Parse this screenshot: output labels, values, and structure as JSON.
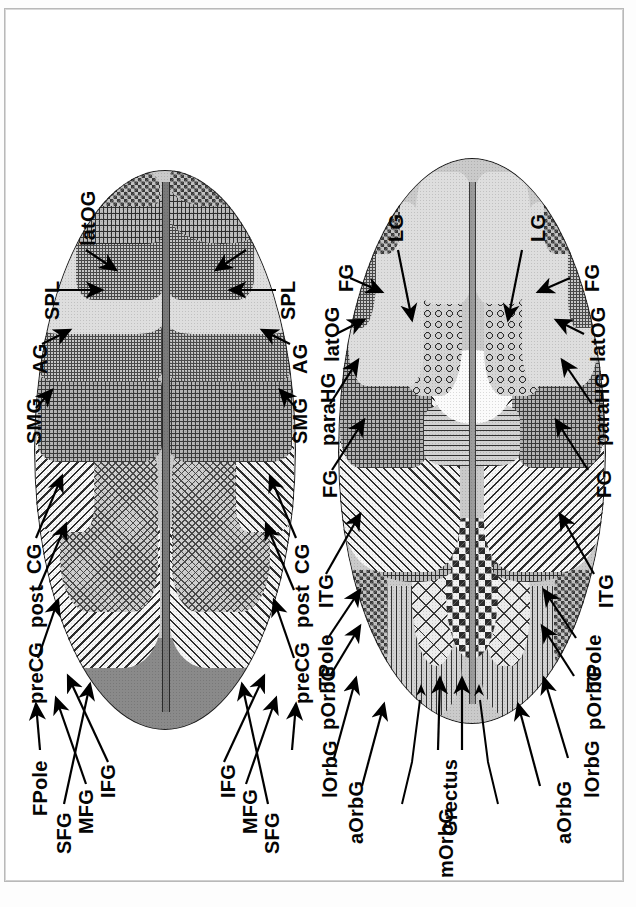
{
  "figure": {
    "type": "anatomical-atlas-plate",
    "orientation": "rotated-90-ccw",
    "panel_count": 2,
    "panels": [
      {
        "id": "panel-superior",
        "view": "superior (dorsal) view of cerebral hemispheres",
        "labels": [
          {
            "id": "p1-l-ifg",
            "text": "IFG"
          },
          {
            "id": "p1-l-mfg",
            "text": "MFG"
          },
          {
            "id": "p1-l-sfg",
            "text": "SFG"
          },
          {
            "id": "p1-l-fpole",
            "text": "FPole"
          },
          {
            "id": "p1-r-sfg",
            "text": "SFG"
          },
          {
            "id": "p1-r-mfg",
            "text": "MFG"
          },
          {
            "id": "p1-r-ifg",
            "text": "IFG"
          },
          {
            "id": "p1-l-precg",
            "text": "preCG"
          },
          {
            "id": "p1-l-post",
            "text": "post"
          },
          {
            "id": "p1-l-cg",
            "text": "CG"
          },
          {
            "id": "p1-l-smg",
            "text": "SMG"
          },
          {
            "id": "p1-l-ag",
            "text": "AG"
          },
          {
            "id": "p1-l-spl",
            "text": "SPL"
          },
          {
            "id": "p1-latog",
            "text": "latOG"
          },
          {
            "id": "p1-r-spl",
            "text": "SPL"
          },
          {
            "id": "p1-r-ag",
            "text": "AG"
          },
          {
            "id": "p1-r-smg",
            "text": "SMG"
          },
          {
            "id": "p1-r-cg",
            "text": "CG"
          },
          {
            "id": "p1-r-post",
            "text": "post"
          },
          {
            "id": "p1-r-precg",
            "text": "preCG"
          }
        ]
      },
      {
        "id": "panel-inferior",
        "view": "inferior (ventral) view of cerebral hemispheres",
        "labels": [
          {
            "id": "p2-l-lorbg",
            "text": "lOrbG"
          },
          {
            "id": "p2-l-aorbg",
            "text": "aOrbG"
          },
          {
            "id": "p2-morbg",
            "text": "mOrbG"
          },
          {
            "id": "p2-grectus",
            "text": "Grectus"
          },
          {
            "id": "p2-r-aorbg",
            "text": "aOrbG"
          },
          {
            "id": "p2-r-lorbg",
            "text": "lOrbG"
          },
          {
            "id": "p2-l-porbg",
            "text": "pOrbG"
          },
          {
            "id": "p2-l-tpole",
            "text": "TPole"
          },
          {
            "id": "p2-r-porbg",
            "text": "pOrbG"
          },
          {
            "id": "p2-r-tpole",
            "text": "TPole"
          },
          {
            "id": "p2-l-itg",
            "text": "ITG"
          },
          {
            "id": "p2-l-fg",
            "text": "FG"
          },
          {
            "id": "p2-l-parahg",
            "text": "paraHG"
          },
          {
            "id": "p2-l-latog",
            "text": "latOG"
          },
          {
            "id": "p2-l-fg2",
            "text": "FG"
          },
          {
            "id": "p2-l-lg",
            "text": "LG"
          },
          {
            "id": "p2-r-lg",
            "text": "LG"
          },
          {
            "id": "p2-r-fg",
            "text": "FG"
          },
          {
            "id": "p2-r-latog",
            "text": "latOG"
          },
          {
            "id": "p2-r-parahg",
            "text": "paraHG"
          },
          {
            "id": "p2-r-fg2",
            "text": "FG"
          },
          {
            "id": "p2-r-itg",
            "text": "ITG"
          }
        ]
      }
    ],
    "abbreviation_glossary": [
      {
        "abbr": "IFG",
        "meaning": "inferior frontal gyrus"
      },
      {
        "abbr": "MFG",
        "meaning": "middle frontal gyrus"
      },
      {
        "abbr": "SFG",
        "meaning": "superior frontal gyrus"
      },
      {
        "abbr": "FPole",
        "meaning": "frontal pole"
      },
      {
        "abbr": "preCG",
        "meaning": "precentral gyrus"
      },
      {
        "abbr": "post CG",
        "meaning": "postcentral gyrus"
      },
      {
        "abbr": "SMG",
        "meaning": "supramarginal gyrus"
      },
      {
        "abbr": "AG",
        "meaning": "angular gyrus"
      },
      {
        "abbr": "SPL",
        "meaning": "superior parietal lobule"
      },
      {
        "abbr": "latOG",
        "meaning": "lateral occipital gyrus"
      },
      {
        "abbr": "lOrbG",
        "meaning": "lateral orbital gyrus"
      },
      {
        "abbr": "aOrbG",
        "meaning": "anterior orbital gyrus"
      },
      {
        "abbr": "mOrbG",
        "meaning": "medial orbital gyrus"
      },
      {
        "abbr": "pOrbG",
        "meaning": "posterior orbital gyrus"
      },
      {
        "abbr": "Grectus",
        "meaning": "gyrus rectus"
      },
      {
        "abbr": "TPole",
        "meaning": "temporal pole"
      },
      {
        "abbr": "ITG",
        "meaning": "inferior temporal gyrus"
      },
      {
        "abbr": "FG",
        "meaning": "fusiform gyrus"
      },
      {
        "abbr": "paraHG",
        "meaning": "parahippocampal gyrus"
      },
      {
        "abbr": "LG",
        "meaning": "lingual gyrus"
      }
    ],
    "colors": {
      "page_background": "#ffffff",
      "frame_border": "#b9b9b9",
      "ink": "#050505"
    }
  }
}
